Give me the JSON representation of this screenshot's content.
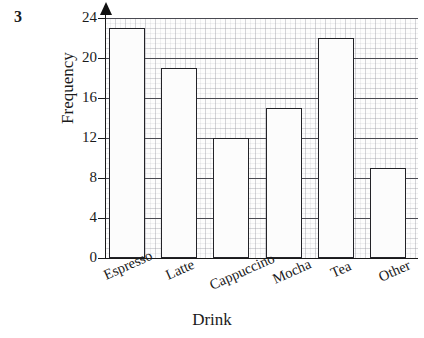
{
  "question_number": "3",
  "chart_data": {
    "type": "bar",
    "title": "",
    "xlabel": "Drink",
    "ylabel": "Frequency",
    "categories": [
      "Espresso",
      "Latte",
      "Cappuccino",
      "Mocha",
      "Tea",
      "Other"
    ],
    "values": [
      23,
      19,
      12,
      15,
      22,
      9
    ],
    "ylim": [
      0,
      24
    ],
    "yticks": [
      0,
      4,
      8,
      12,
      16,
      20,
      24
    ],
    "ytick_labels": [
      "0",
      "4",
      "8",
      "12",
      "16",
      "20",
      "24"
    ],
    "minor_tick_step": 1,
    "major_gridline_step": 4,
    "grid": true,
    "legend": "none",
    "bar_fill": "#fcfcfc",
    "bar_edge": "#232328",
    "grid_color": "#9696a0",
    "axis_color": "#1a1a1a"
  }
}
